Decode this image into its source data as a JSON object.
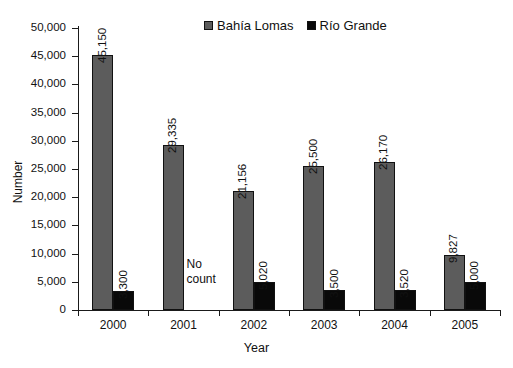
{
  "chart_data": {
    "type": "bar",
    "title": "",
    "xlabel": "Year",
    "ylabel": "Number",
    "categories": [
      "2000",
      "2001",
      "2002",
      "2003",
      "2004",
      "2005"
    ],
    "ylim": [
      0,
      50000
    ],
    "ytick_values": [
      0,
      5000,
      10000,
      15000,
      20000,
      25000,
      30000,
      35000,
      40000,
      45000,
      50000
    ],
    "ytick_labels": [
      "0",
      "5,000",
      "10,000",
      "15,000",
      "20,000",
      "25,000",
      "30,000",
      "35,000",
      "40,000",
      "45,000",
      "50,000"
    ],
    "grid": false,
    "legend_position": "top-center",
    "series": [
      {
        "name": "Bahía  Lomas",
        "color": "#5c5c5c",
        "values": [
          45150,
          29335,
          21156,
          25500,
          26170,
          9827
        ],
        "value_labels": [
          "45,150",
          "29,335",
          "21,156",
          "25,500",
          "26,170",
          "9,827"
        ]
      },
      {
        "name": "Río Grande",
        "color": "#090909",
        "values": [
          3300,
          null,
          5020,
          3500,
          3520,
          5000
        ],
        "value_labels": [
          "3,300",
          "",
          "5,020",
          "3,500",
          "3,520",
          "5,000"
        ]
      }
    ],
    "annotations": [
      {
        "text": "No\ncount",
        "category": "2001",
        "series": "Río Grande"
      }
    ]
  },
  "legend": {
    "entries": [
      {
        "label": "Bahía  Lomas",
        "swatch": "gray"
      },
      {
        "label": "Río Grande",
        "swatch": "black"
      }
    ]
  },
  "axes": {
    "y_title": "Number",
    "x_title": "Year"
  }
}
